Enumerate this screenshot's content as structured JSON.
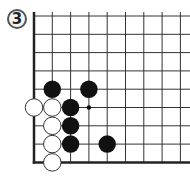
{
  "problem": {
    "number": "3",
    "colors": {
      "line": "#333333",
      "edge": "#222222",
      "black": "#111111",
      "white": "#ffffff",
      "white_outline": "#333333"
    }
  },
  "grid": {
    "origin_x": 34,
    "origin_y": 16,
    "spacing": 18.3,
    "cols": 9,
    "rows": 9,
    "left_edge": true,
    "bottom_edge": true,
    "top_open": true,
    "right_open": true
  },
  "stones": {
    "black": [
      [
        1,
        4
      ],
      [
        3,
        4
      ],
      [
        2,
        5
      ],
      [
        2,
        6
      ],
      [
        2,
        7
      ],
      [
        4,
        7
      ]
    ],
    "white": [
      [
        0,
        5
      ],
      [
        1,
        5
      ],
      [
        1,
        6
      ],
      [
        1,
        7
      ],
      [
        1,
        8
      ]
    ]
  },
  "markers": [
    {
      "type": "dot",
      "col": 3,
      "row": 5
    }
  ]
}
